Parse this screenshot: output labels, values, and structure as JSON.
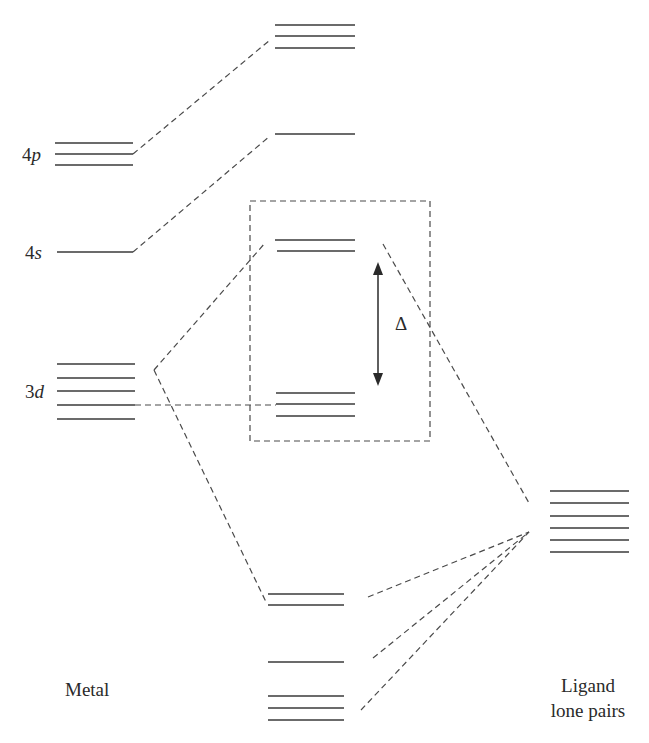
{
  "diagram": {
    "labels": {
      "metal": "Metal",
      "ligand_line1": "Ligand",
      "ligand_line2": "lone pairs",
      "delta": "Δ",
      "orb_4p_num": "4",
      "orb_4p_letter": "p",
      "orb_4s_num": "4",
      "orb_4s_letter": "s",
      "orb_3d_num": "3",
      "orb_3d_letter": "d"
    },
    "metal_levels": {
      "4p": [
        143,
        154,
        165
      ],
      "4s": [
        252
      ],
      "3d": [
        364,
        378,
        391,
        405,
        419
      ]
    },
    "mo_levels": {
      "t1u_antibonding": [
        25,
        36,
        48
      ],
      "a1g_antibonding": [
        134
      ],
      "eg_antibonding": [
        240,
        251
      ],
      "t2g_nonbonding": [
        393,
        404,
        416
      ],
      "eg_bonding": [
        594,
        605
      ],
      "a1g_bonding": [
        662
      ],
      "t1u_bonding": [
        696,
        708,
        720
      ]
    },
    "ligand_levels": [
      491,
      503,
      516,
      528,
      540,
      552
    ],
    "colors": {
      "line": "#3a3a3a",
      "dash": "#4a4a4a",
      "text": "#2a2a2a"
    }
  }
}
